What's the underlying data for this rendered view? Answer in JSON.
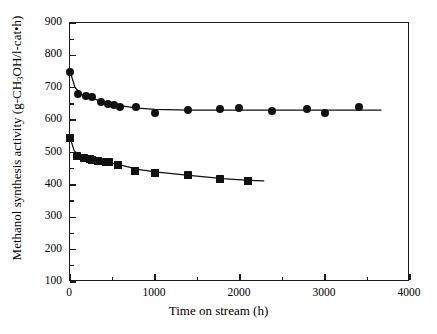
{
  "chart_data": {
    "type": "scatter",
    "title": "",
    "xlabel": "Time on stream (h)",
    "ylabel_html": "Methanol synthesis activity (g-CH<sub>3</sub>OH/l-cat•h)",
    "ylabel": "Methanol synthesis activity (g-CH3OH/l-cat•h)",
    "xlim": [
      0,
      4000
    ],
    "ylim": [
      100,
      900
    ],
    "xticks": [
      0,
      1000,
      2000,
      3000,
      4000
    ],
    "xtick_labels": [
      "0",
      "1000",
      "2000",
      "3000",
      "4000"
    ],
    "yticks": [
      100,
      200,
      300,
      400,
      500,
      600,
      700,
      800,
      900
    ],
    "ytick_labels": [
      "100",
      "200",
      "300",
      "400",
      "500",
      "600",
      "700",
      "800",
      "900"
    ],
    "xminor_interval": 500,
    "yminor_interval": 50,
    "grid": false,
    "legend": "none",
    "series": [
      {
        "name": "circle-series",
        "marker": "circle",
        "color": "#111111",
        "marker_size": 8,
        "points": [
          {
            "x": 0,
            "y": 750
          },
          {
            "x": 90,
            "y": 681
          },
          {
            "x": 190,
            "y": 673
          },
          {
            "x": 260,
            "y": 672
          },
          {
            "x": 370,
            "y": 656
          },
          {
            "x": 450,
            "y": 650
          },
          {
            "x": 520,
            "y": 647
          },
          {
            "x": 590,
            "y": 641
          },
          {
            "x": 780,
            "y": 639
          },
          {
            "x": 1000,
            "y": 622
          },
          {
            "x": 1390,
            "y": 630
          },
          {
            "x": 1760,
            "y": 633
          },
          {
            "x": 1990,
            "y": 636
          },
          {
            "x": 2380,
            "y": 627
          },
          {
            "x": 2790,
            "y": 635
          },
          {
            "x": 3000,
            "y": 621
          },
          {
            "x": 3400,
            "y": 642
          }
        ],
        "trend": [
          {
            "x": 0,
            "y": 751
          },
          {
            "x": 60,
            "y": 700
          },
          {
            "x": 140,
            "y": 678
          },
          {
            "x": 260,
            "y": 667
          },
          {
            "x": 420,
            "y": 654
          },
          {
            "x": 600,
            "y": 644
          },
          {
            "x": 800,
            "y": 637
          },
          {
            "x": 1000,
            "y": 633
          },
          {
            "x": 1400,
            "y": 631
          },
          {
            "x": 2000,
            "y": 631
          },
          {
            "x": 2600,
            "y": 631
          },
          {
            "x": 3200,
            "y": 631
          },
          {
            "x": 3660,
            "y": 631
          }
        ]
      },
      {
        "name": "square-series",
        "marker": "square",
        "color": "#111111",
        "marker_size": 8,
        "points": [
          {
            "x": 0,
            "y": 545
          },
          {
            "x": 80,
            "y": 489
          },
          {
            "x": 170,
            "y": 482
          },
          {
            "x": 230,
            "y": 481
          },
          {
            "x": 260,
            "y": 478
          },
          {
            "x": 330,
            "y": 473
          },
          {
            "x": 420,
            "y": 471
          },
          {
            "x": 460,
            "y": 470
          },
          {
            "x": 570,
            "y": 462
          },
          {
            "x": 770,
            "y": 444
          },
          {
            "x": 1000,
            "y": 437
          },
          {
            "x": 1390,
            "y": 430
          },
          {
            "x": 1760,
            "y": 417
          },
          {
            "x": 2090,
            "y": 413
          }
        ],
        "trend": [
          {
            "x": 0,
            "y": 546
          },
          {
            "x": 50,
            "y": 505
          },
          {
            "x": 120,
            "y": 489
          },
          {
            "x": 240,
            "y": 480
          },
          {
            "x": 400,
            "y": 472
          },
          {
            "x": 600,
            "y": 461
          },
          {
            "x": 800,
            "y": 448
          },
          {
            "x": 1000,
            "y": 440
          },
          {
            "x": 1400,
            "y": 429
          },
          {
            "x": 1800,
            "y": 419
          },
          {
            "x": 2100,
            "y": 414
          },
          {
            "x": 2280,
            "y": 412
          }
        ]
      }
    ]
  }
}
